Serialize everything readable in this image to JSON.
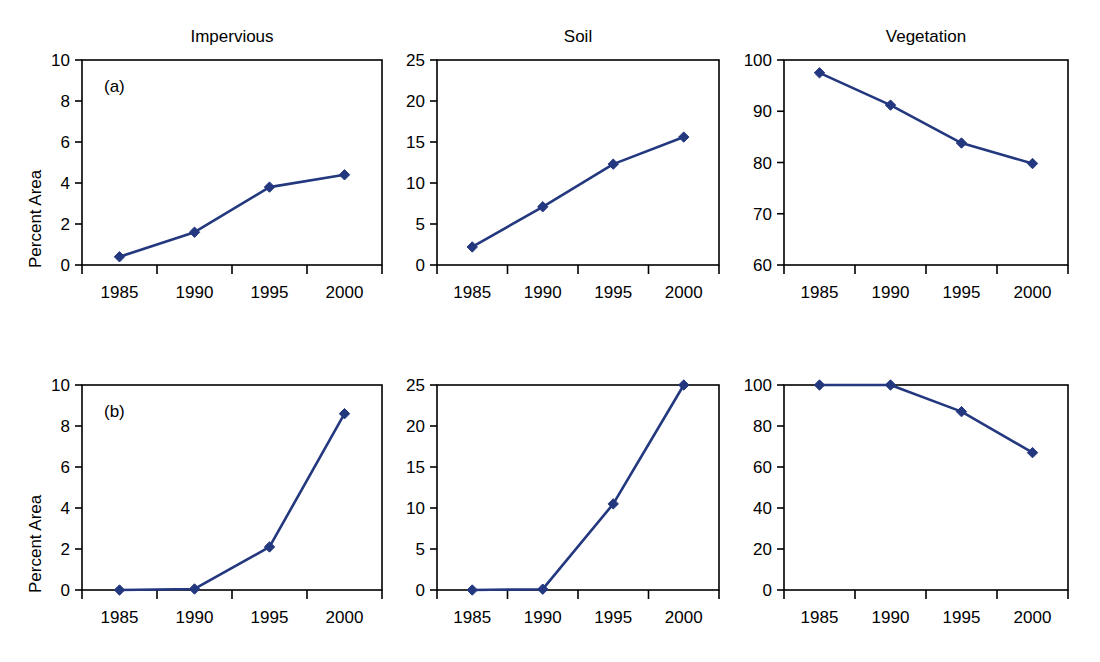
{
  "figure": {
    "width": 1100,
    "height": 662,
    "background": "#ffffff",
    "series_color": "#23387e",
    "axis_color": "#000000",
    "y_axis_label": "Percent Area",
    "column_titles": [
      "Impervious",
      "Soil",
      "Vegetation"
    ],
    "row_tags": [
      "(a)",
      "(b)"
    ],
    "x_tick_labels": [
      "1985",
      "1990",
      "1995",
      "2000"
    ]
  },
  "chart_data": [
    {
      "type": "line",
      "panel": "a-impervious",
      "title": "Impervious",
      "tag": "(a)",
      "xlabel": "",
      "ylabel": "Percent Area",
      "categories": [
        "1985",
        "1990",
        "1995",
        "2000"
      ],
      "values": [
        0.4,
        1.6,
        3.8,
        4.4
      ],
      "ylim": [
        0,
        10
      ],
      "yticks": [
        0,
        2,
        4,
        6,
        8,
        10
      ],
      "ytick_labels": [
        "0",
        "2",
        "4",
        "6",
        "8",
        "10"
      ],
      "grid": false,
      "legend": "none",
      "marker": "diamond",
      "color": "#23387e"
    },
    {
      "type": "line",
      "panel": "a-soil",
      "title": "Soil",
      "tag": "",
      "xlabel": "",
      "ylabel": "",
      "categories": [
        "1985",
        "1990",
        "1995",
        "2000"
      ],
      "values": [
        2.2,
        7.1,
        12.3,
        15.6
      ],
      "ylim": [
        0,
        25
      ],
      "yticks": [
        0,
        5,
        10,
        15,
        20,
        25
      ],
      "ytick_labels": [
        "0",
        "5",
        "10",
        "15",
        "20",
        "25"
      ],
      "grid": false,
      "legend": "none",
      "marker": "diamond",
      "color": "#23387e"
    },
    {
      "type": "line",
      "panel": "a-vegetation",
      "title": "Vegetation",
      "tag": "",
      "xlabel": "",
      "ylabel": "",
      "categories": [
        "1985",
        "1990",
        "1995",
        "2000"
      ],
      "values": [
        97.5,
        91.2,
        83.8,
        79.8
      ],
      "ylim": [
        60,
        100
      ],
      "yticks": [
        60,
        70,
        80,
        90,
        100
      ],
      "ytick_labels": [
        "60",
        "70",
        "80",
        "90",
        "100"
      ],
      "grid": false,
      "legend": "none",
      "marker": "diamond",
      "color": "#23387e"
    },
    {
      "type": "line",
      "panel": "b-impervious",
      "title": "",
      "tag": "(b)",
      "xlabel": "",
      "ylabel": "Percent Area",
      "categories": [
        "1985",
        "1990",
        "1995",
        "2000"
      ],
      "values": [
        0.0,
        0.05,
        2.1,
        8.6
      ],
      "ylim": [
        0,
        10
      ],
      "yticks": [
        0,
        2,
        4,
        6,
        8,
        10
      ],
      "ytick_labels": [
        "0",
        "2",
        "4",
        "6",
        "8",
        "10"
      ],
      "grid": false,
      "legend": "none",
      "marker": "diamond",
      "color": "#23387e"
    },
    {
      "type": "line",
      "panel": "b-soil",
      "title": "",
      "tag": "",
      "xlabel": "",
      "ylabel": "",
      "categories": [
        "1985",
        "1990",
        "1995",
        "2000"
      ],
      "values": [
        0.0,
        0.1,
        10.5,
        25.0
      ],
      "ylim": [
        0,
        25
      ],
      "yticks": [
        0,
        5,
        10,
        15,
        20,
        25
      ],
      "ytick_labels": [
        "0",
        "5",
        "10",
        "15",
        "20",
        "25"
      ],
      "grid": false,
      "legend": "none",
      "marker": "diamond",
      "color": "#23387e"
    },
    {
      "type": "line",
      "panel": "b-vegetation",
      "title": "",
      "tag": "",
      "xlabel": "",
      "ylabel": "",
      "categories": [
        "1985",
        "1990",
        "1995",
        "2000"
      ],
      "values": [
        100.0,
        100.0,
        87.0,
        67.0
      ],
      "ylim": [
        0,
        100
      ],
      "yticks": [
        0,
        20,
        40,
        60,
        80,
        100
      ],
      "ytick_labels": [
        "0",
        "20",
        "40",
        "60",
        "80",
        "100"
      ],
      "grid": false,
      "legend": "none",
      "marker": "diamond",
      "color": "#23387e"
    }
  ],
  "layout": {
    "panels": [
      {
        "key": "a-impervious",
        "left": 0,
        "top": 0,
        "plot_x": 82,
        "plot_y": 60,
        "plot_w": 300,
        "plot_h": 205,
        "title_x": 232,
        "title_y": 42,
        "show_ylabel": true,
        "ylabel_x": 26,
        "ylabel_y": 268
      },
      {
        "key": "a-soil",
        "left": 0,
        "top": 0,
        "plot_x": 437,
        "plot_y": 60,
        "plot_w": 282,
        "plot_h": 205,
        "title_x": 578,
        "title_y": 42,
        "show_ylabel": false,
        "ylabel_x": 0,
        "ylabel_y": 0
      },
      {
        "key": "a-vegetation",
        "left": 0,
        "top": 0,
        "plot_x": 784,
        "plot_y": 60,
        "plot_w": 284,
        "plot_h": 205,
        "title_x": 926,
        "title_y": 42,
        "show_ylabel": false,
        "ylabel_x": 0,
        "ylabel_y": 0
      },
      {
        "key": "b-impervious",
        "left": 0,
        "top": 0,
        "plot_x": 82,
        "plot_y": 385,
        "plot_w": 300,
        "plot_h": 205,
        "title_x": 232,
        "title_y": 367,
        "show_ylabel": true,
        "ylabel_x": 26,
        "ylabel_y": 593
      },
      {
        "key": "b-soil",
        "left": 0,
        "top": 0,
        "plot_x": 437,
        "plot_y": 385,
        "plot_w": 282,
        "plot_h": 205,
        "title_x": 578,
        "title_y": 367,
        "show_ylabel": false,
        "ylabel_x": 0,
        "ylabel_y": 0
      },
      {
        "key": "b-vegetation",
        "left": 0,
        "top": 0,
        "plot_x": 784,
        "plot_y": 385,
        "plot_w": 284,
        "plot_h": 205,
        "title_x": 926,
        "title_y": 367,
        "show_ylabel": false,
        "ylabel_x": 0,
        "ylabel_y": 0
      }
    ]
  }
}
